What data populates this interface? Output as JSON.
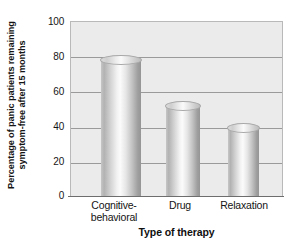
{
  "chart_data": {
    "type": "bar",
    "title": "",
    "categories": [
      "Cognitive-behavioral",
      "Drug",
      "Relaxation"
    ],
    "category_lines": [
      [
        "Cognitive-",
        "behavioral"
      ],
      [
        "Drug"
      ],
      [
        "Relaxation"
      ]
    ],
    "values": [
      78,
      52,
      39
    ],
    "xlabel": "Type of therapy",
    "ylabel": "Percentage of panic patients remaining symptom-free after 15 months",
    "ylabel_lines": [
      "Percentage of panic patients remaining",
      "symptom-free after 15 months"
    ],
    "ylim": [
      0,
      100
    ],
    "yticks": [
      0,
      20,
      40,
      60,
      80,
      100
    ],
    "ytick_labels": [
      "0",
      "20",
      "40",
      "60",
      "80",
      "100"
    ],
    "grid": true,
    "legend": null,
    "style": "3d-cylinder-grayscale",
    "colors": {
      "plot_background": "#ebebeb",
      "page_background": "#ffffff",
      "gridline": "#9a9a9a",
      "frame": "#b9b9b9",
      "bar_light": "#fbfbfb",
      "bar_dark": "#959595",
      "text": "#141414"
    }
  }
}
